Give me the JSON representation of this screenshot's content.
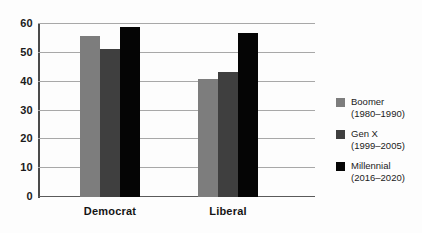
{
  "chart_data": {
    "type": "bar",
    "title": "",
    "subtitle": "",
    "xlabel": "",
    "ylabel": "",
    "ylim": [
      0,
      60
    ],
    "yticks": [
      0,
      10,
      20,
      30,
      40,
      50,
      60
    ],
    "ytick_labels": [
      "0",
      "10",
      "20",
      "30",
      "40",
      "50",
      "60"
    ],
    "grid": "horizontal",
    "legend_position": "right",
    "categories": [
      "Democrat",
      "Liberal"
    ],
    "series": [
      {
        "name": "Boomer",
        "range": "(1980–1990)",
        "color": "#7d7d7d",
        "values": [
          56,
          41
        ]
      },
      {
        "name": "Gen X",
        "range": "(1999–2005)",
        "color": "#3f3f3f",
        "values": [
          51.5,
          43.5
        ]
      },
      {
        "name": "Millennial",
        "range": "(2016–2020)",
        "color": "#050505",
        "values": [
          59,
          57
        ]
      }
    ]
  }
}
